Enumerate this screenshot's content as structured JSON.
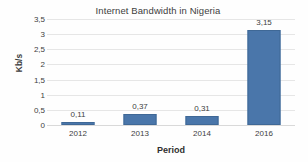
{
  "chart_data": {
    "type": "bar",
    "title": "Internet Bandwidth in Nigeria",
    "xlabel": "Period",
    "ylabel": "Kb/s",
    "categories": [
      "2012",
      "2013",
      "2014",
      "2016"
    ],
    "values": [
      0.11,
      0.37,
      0.31,
      3.15
    ],
    "value_labels": [
      "0,11",
      "0,37",
      "0,31",
      "3,15"
    ],
    "ylim": [
      0,
      3.5
    ],
    "ytick_values": [
      0,
      0.5,
      1,
      1.5,
      2,
      2.5,
      3,
      3.5
    ],
    "ytick_labels": [
      "0",
      "0,5",
      "1",
      "1,5",
      "2",
      "2,5",
      "3",
      "3,5"
    ],
    "grid": true,
    "legend": false,
    "decimal_separator": ",",
    "series": [
      {
        "name": "Internet Bandwidth",
        "values": [
          0.11,
          0.37,
          0.31,
          3.15
        ]
      }
    ],
    "colors": {
      "bar_fill": "#4a76aa",
      "bar_border": "#3f6896",
      "gridline": "#e6e6e6",
      "text": "#404040",
      "background": "#fefefe"
    }
  }
}
